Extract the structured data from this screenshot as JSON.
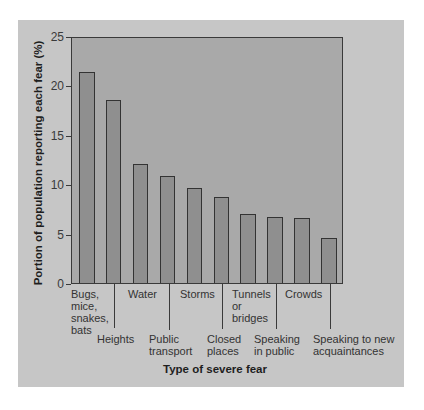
{
  "chart_data": {
    "type": "bar",
    "title": "",
    "xlabel": "Type of severe fear",
    "ylabel": "Portion of population reporting each fear (%)",
    "ylim": [
      0,
      25
    ],
    "yticks": [
      0,
      5,
      10,
      15,
      20,
      25
    ],
    "grid": false,
    "legend": null,
    "categories": [
      "Bugs, mice, snakes, bats",
      "Heights",
      "Water",
      "Public transport",
      "Storms",
      "Closed places",
      "Tunnels or bridges",
      "Speaking in public",
      "Crowds",
      "Speaking to new acquaintances"
    ],
    "values": [
      21.4,
      18.6,
      12.1,
      10.9,
      9.7,
      8.7,
      7.0,
      6.7,
      6.6,
      4.6
    ],
    "colors": {
      "panel": "#c6c6c6",
      "plot_background": "#a9a9a9",
      "bar_fill": "#8f8f8f",
      "bar_border": "#333333"
    }
  },
  "axis": {
    "y_tick_labels": [
      "25",
      "20",
      "15",
      "10",
      "5",
      "0"
    ],
    "x_labels": [
      {
        "text": "Bugs,\nmice,\nsnakes,\nbats"
      },
      {
        "text": "Heights"
      },
      {
        "text": "Water"
      },
      {
        "text": "Public\ntransport"
      },
      {
        "text": "Storms"
      },
      {
        "text": "Closed\nplaces"
      },
      {
        "text": "Tunnels\nor\nbridges"
      },
      {
        "text": "Speaking\nin public"
      },
      {
        "text": "Crowds"
      },
      {
        "text": "Speaking to new\nacquaintances"
      }
    ]
  }
}
